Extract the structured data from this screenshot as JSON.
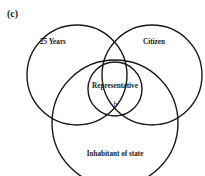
{
  "figure": {
    "panel_label": "(c)",
    "type": "venn",
    "stroke_color": "#1a1a1a",
    "background": "#ffffff"
  },
  "sets": [
    {
      "id": "age",
      "label": "25 Years",
      "cx": 77,
      "cy": 75,
      "r": 50,
      "label_x": 40,
      "label_y": 44
    },
    {
      "id": "citizen",
      "label": "Citizen",
      "cx": 152,
      "cy": 75,
      "r": 50,
      "label_x": 154,
      "label_y": 44
    },
    {
      "id": "inhabitant",
      "label": "Inhabitant of state",
      "cx": 115,
      "cy": 123,
      "r": 63,
      "label_x": 115,
      "label_y": 156
    },
    {
      "id": "representative",
      "label": "Representative",
      "cx": 115,
      "cy": 89,
      "r": 27,
      "label_x": 115,
      "label_y": 88
    }
  ],
  "annotations": [
    {
      "id": "element-b",
      "text": "b",
      "x": 115,
      "y": 107
    }
  ]
}
